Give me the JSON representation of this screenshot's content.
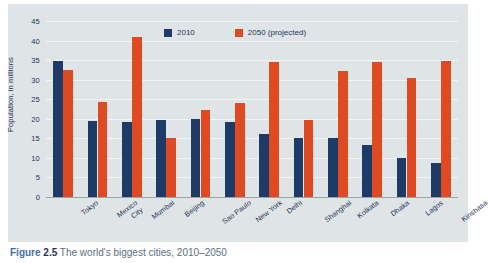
{
  "caption": {
    "figure_word": "Figure",
    "number": "2.5",
    "text": "The world's biggest cities, 2010–2050"
  },
  "legend": {
    "items": [
      {
        "label": "2010",
        "color": "#1e3a67"
      },
      {
        "label": "2050 (projected)",
        "color": "#e04a22"
      }
    ]
  },
  "axis": {
    "y_title": "Population, in millions",
    "y_ticks": [
      "0",
      "5",
      "10",
      "15",
      "20",
      "25",
      "30",
      "35",
      "40",
      "45"
    ]
  },
  "colors": {
    "series_2010": "#1e3a67",
    "series_2050": "#e04a22",
    "panel_background": "#dfe4e6",
    "gridline": "#f2f5f6",
    "axis_line": "#9aa5aa",
    "text": "#1d3557"
  },
  "chart_data": {
    "type": "bar",
    "title": "The world's biggest cities, 2010–2050",
    "xlabel": "",
    "ylabel": "Population, in millions",
    "ylim": [
      0,
      45
    ],
    "ytick_step": 5,
    "grid": true,
    "legend_position": "top-center",
    "categories": [
      "Tokyo",
      "Mexico City",
      "Mumbai",
      "Beijing",
      "Sao Paulo",
      "New York",
      "Delhi",
      "Shanghai",
      "Kolkata",
      "Dhaka",
      "Lagos",
      "Kinshasa"
    ],
    "category_lines": [
      [
        "Tokyo"
      ],
      [
        "Mexico",
        "City"
      ],
      [
        "Mumbai"
      ],
      [
        "Beijing"
      ],
      [
        "Sao Paulo"
      ],
      [
        "New York"
      ],
      [
        "Delhi"
      ],
      [
        "Shanghai"
      ],
      [
        "Kolkata"
      ],
      [
        "Dhaka"
      ],
      [
        "Lagos"
      ],
      [
        "Kinshasa"
      ]
    ],
    "series": [
      {
        "name": "2010",
        "color": "#1e3a67",
        "values": [
          34.7,
          19.5,
          19.2,
          19.6,
          19.9,
          19.3,
          16.1,
          15.2,
          15.2,
          13.4,
          10.0,
          8.8
        ]
      },
      {
        "name": "2050 (projected)",
        "color": "#e04a22",
        "values": [
          32.5,
          24.2,
          40.8,
          15.0,
          22.3,
          24.0,
          34.5,
          19.8,
          32.2,
          34.5,
          30.4,
          34.8
        ]
      }
    ]
  }
}
